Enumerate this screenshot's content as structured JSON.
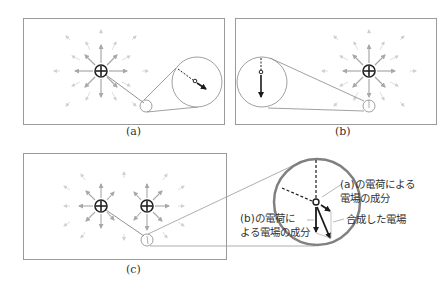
{
  "figure": {
    "panels": [
      {
        "id": "a",
        "caption": "(a)",
        "charges": [
          {
            "x": 101,
            "y": 71,
            "sign": "+"
          }
        ],
        "probe": {
          "x": 146,
          "y": 106
        },
        "zoom_circle": {
          "x": 197,
          "y": 82,
          "r": 25
        },
        "field_direction": "down-right"
      },
      {
        "id": "b",
        "caption": "(b)",
        "charges": [
          {
            "x": 369,
            "y": 71,
            "sign": "+"
          }
        ],
        "probe": {
          "x": 369,
          "y": 106
        },
        "zoom_circle": {
          "x": 262,
          "y": 82,
          "r": 25
        },
        "field_direction": "down"
      },
      {
        "id": "c",
        "caption": "(c)",
        "charges": [
          {
            "x": 101,
            "y": 206,
            "sign": "+"
          },
          {
            "x": 147,
            "y": 206,
            "sign": "+"
          }
        ],
        "probe": {
          "x": 147,
          "y": 240
        },
        "zoom_circle": {
          "x": 317,
          "y": 202,
          "r": 43
        },
        "field_direction": "combined"
      }
    ],
    "annotations": {
      "component_a_line1": "(a)の電荷による",
      "component_a_line2": "電場の成分",
      "resultant": "合成した電場",
      "component_b_line1": "(b)の電荷に",
      "component_b_line2": "よる電場の成分"
    },
    "colors": {
      "frame": "#9a9a9a",
      "field_arrows": "#b5b5b5",
      "vector": "#1a1a1a",
      "zoom_ring_c": "#808080"
    }
  }
}
